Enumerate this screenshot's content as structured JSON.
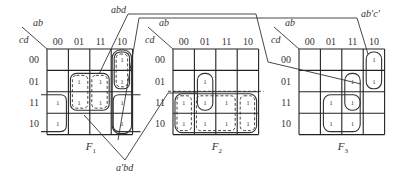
{
  "diagram": {
    "type": "karnaugh-maps",
    "row_variable_label": "cd",
    "col_variable_label": "ab",
    "col_headers": [
      "00",
      "01",
      "11",
      "10"
    ],
    "row_headers": [
      "00",
      "01",
      "11",
      "10"
    ],
    "maps": [
      {
        "name": "F",
        "subscript": "1",
        "ones": [
          {
            "row": "00",
            "col": "10"
          },
          {
            "row": "01",
            "col": "01"
          },
          {
            "row": "01",
            "col": "11"
          },
          {
            "row": "01",
            "col": "10"
          },
          {
            "row": "11",
            "col": "00"
          },
          {
            "row": "11",
            "col": "01"
          },
          {
            "row": "11",
            "col": "11"
          },
          {
            "row": "11",
            "col": "10"
          },
          {
            "row": "10",
            "col": "00"
          },
          {
            "row": "10",
            "col": "10"
          }
        ]
      },
      {
        "name": "F",
        "subscript": "2",
        "ones": [
          {
            "row": "01",
            "col": "01"
          },
          {
            "row": "11",
            "col": "00"
          },
          {
            "row": "11",
            "col": "01"
          },
          {
            "row": "11",
            "col": "11"
          },
          {
            "row": "11",
            "col": "10"
          },
          {
            "row": "10",
            "col": "00"
          },
          {
            "row": "10",
            "col": "01"
          },
          {
            "row": "10",
            "col": "11"
          },
          {
            "row": "10",
            "col": "10"
          }
        ]
      },
      {
        "name": "F",
        "subscript": "3",
        "ones": [
          {
            "row": "00",
            "col": "10"
          },
          {
            "row": "01",
            "col": "10"
          },
          {
            "row": "01",
            "col": "11"
          },
          {
            "row": "11",
            "col": "01"
          },
          {
            "row": "11",
            "col": "11"
          },
          {
            "row": "10",
            "col": "01"
          },
          {
            "row": "10",
            "col": "11"
          }
        ]
      }
    ],
    "annotations": {
      "abd": "abd",
      "abc": "ab′c′",
      "abd_prime": "a′bd"
    },
    "one_symbol": "1"
  }
}
